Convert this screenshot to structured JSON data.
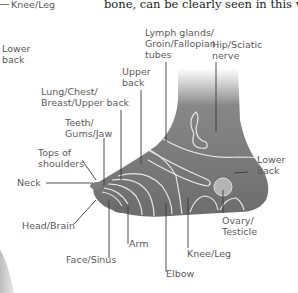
{
  "caption": "bone, can be clearly seen in this view.",
  "previous_figure": {
    "labels": [
      "Knee/Leg",
      "Lower\nback"
    ]
  },
  "diagram": {
    "labels": {
      "lymph": "Lymph glands/\nGroin/Fallopian\ntubes",
      "hip": "Hip/Sciatic\nnerve",
      "upper_back": "Upper\nback",
      "lung": "Lung/Chest/\nBreast/Upper back",
      "teeth": "Teeth/\nGums/Jaw",
      "tops_shoulders": "Tops of\nshoulders",
      "neck": "Neck",
      "head": "Head/Brain",
      "face": "Face/Sinus",
      "arm": "Arm",
      "elbow": "Elbow",
      "knee": "Knee/Leg",
      "ovary": "Ovary/\nTesticle",
      "lower_back": "Lower\nback"
    },
    "colors": {
      "foot": "#6e6e6e",
      "zone_lines": "#e8e8e8",
      "leader_lines": "#3a3a3a"
    }
  }
}
